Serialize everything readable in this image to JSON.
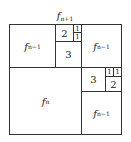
{
  "diagram": {
    "title": {
      "base": "f",
      "sub": "n+1"
    },
    "cells": [
      {
        "id": "top-left",
        "base": "f",
        "sub": "n−1"
      },
      {
        "id": "top-mid-2",
        "text": "2"
      },
      {
        "id": "top-mid-1a",
        "text": "1"
      },
      {
        "id": "top-mid-1b",
        "text": "1"
      },
      {
        "id": "top-mid-3",
        "text": "3"
      },
      {
        "id": "top-right",
        "base": "f",
        "sub": "n−1"
      },
      {
        "id": "bottom-left",
        "base": "f",
        "sub": "n"
      },
      {
        "id": "mid-right-3",
        "text": "3"
      },
      {
        "id": "mid-right-1a",
        "text": "1"
      },
      {
        "id": "mid-right-1b",
        "text": "1"
      },
      {
        "id": "mid-right-2",
        "text": "2"
      },
      {
        "id": "bottom-right",
        "base": "f",
        "sub": "n−1"
      }
    ]
  }
}
